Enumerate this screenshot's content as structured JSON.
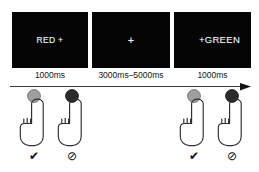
{
  "figure": {
    "background_color": "#ffffff"
  },
  "stimuli": {
    "panels": [
      {
        "id": "panel-red",
        "text": "RED +",
        "background_color": "#050505",
        "text_color": "#f2f2f2",
        "duration_label": "1000ms"
      },
      {
        "id": "panel-fixation",
        "text": "+",
        "background_color": "#050505",
        "text_color": "#f2f2f2",
        "duration_label": "3000ms–5000ms"
      },
      {
        "id": "panel-green",
        "text": "+GREEN",
        "background_color": "#050505",
        "text_color": "#f2f2f2",
        "duration_label": "1000ms"
      }
    ]
  },
  "timeline": {
    "direction": "left-to-right",
    "arrow_color": "#3b3b3b"
  },
  "responses": {
    "units": [
      {
        "id": "response-1",
        "button_state": "released",
        "button_color": "#a0a0a0",
        "button_label": "light-gray-button",
        "hand_label": "pointing-hand",
        "outcome_icon": "✔",
        "outcome_name": "allowed",
        "outcome_color": "#111111"
      },
      {
        "id": "response-2",
        "button_state": "pressed",
        "button_color": "#2b2b2b",
        "button_label": "dark-button",
        "hand_label": "pointing-hand",
        "outcome_icon": "⊘",
        "outcome_name": "blocked",
        "outcome_color": "#111111"
      },
      {
        "id": "response-3",
        "button_state": "released",
        "button_color": "#a0a0a0",
        "button_label": "light-gray-button",
        "hand_label": "pointing-hand",
        "outcome_icon": "✔",
        "outcome_name": "allowed",
        "outcome_color": "#111111"
      },
      {
        "id": "response-4",
        "button_state": "pressed",
        "button_color": "#2b2b2b",
        "button_label": "dark-button",
        "hand_label": "pointing-hand",
        "outcome_icon": "⊘",
        "outcome_name": "blocked",
        "outcome_color": "#111111"
      }
    ]
  }
}
